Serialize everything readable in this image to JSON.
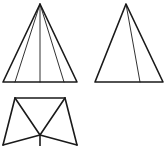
{
  "diagram": {
    "type": "geometry-views",
    "stroke_color": "#1a1a1a",
    "background": "#ffffff",
    "figures": [
      {
        "id": "front-view",
        "description": "Isosceles triangle with three internal lines from apex to base",
        "apex": [
          40,
          4
        ],
        "base": [
          [
            3,
            82
          ],
          [
            77,
            82
          ]
        ],
        "inner_lines_base_x": [
          15,
          40,
          64
        ]
      },
      {
        "id": "side-view",
        "description": "Triangle with one internal line from apex to base",
        "apex": [
          126,
          4
        ],
        "base": [
          [
            95,
            82
          ],
          [
            164,
            82
          ]
        ],
        "inner_lines_base_x": [
          140
        ]
      },
      {
        "id": "top-view",
        "description": "Trapezoid with diagonals meeting at a center point and a vertical segment down to the bottom",
        "top_edge": [
          [
            15,
            98
          ],
          [
            65,
            98
          ]
        ],
        "bottom_corners": [
          [
            3,
            146
          ],
          [
            77,
            146
          ]
        ],
        "center": [
          40,
          140
        ],
        "stem_bottom": [
          40,
          146
        ]
      }
    ]
  }
}
